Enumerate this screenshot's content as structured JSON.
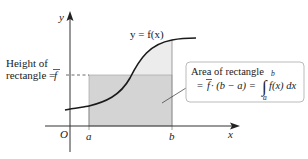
{
  "diagram": {
    "type": "mean-value-theorem-for-integrals",
    "axes": {
      "x_label": "x",
      "y_label": "y",
      "origin_label": "O"
    },
    "ticks": {
      "a_label": "a",
      "b_label": "b"
    },
    "curve_label": "y = f(x)",
    "height_label": {
      "line1": "Height of",
      "line2": "rectangle = ",
      "fbar": "f"
    },
    "area_box": {
      "line1": "Area of rectangle",
      "eq_prefix": "= ",
      "fbar": "f",
      "eq_mid": " · (b − a) = ",
      "integral_upper": "b",
      "integral_lower": "a",
      "integrand": "f(x) dx"
    },
    "colors": {
      "region_under_curve": "#ebebeb",
      "rectangle": "#d6d6d6",
      "curve": "#1a1a1a",
      "axes": "#333333",
      "box_border": "#bbbbbb"
    }
  }
}
